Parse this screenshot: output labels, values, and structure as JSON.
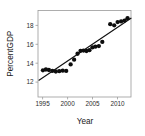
{
  "chart_data": {
    "type": "scatter",
    "title": "",
    "xlabel": "Year",
    "ylabel": "PercentGDP",
    "xlim": [
      1994.0,
      1912.8
    ],
    "x_range": [
      1994.0,
      2012.8
    ],
    "ylim": [
      11.3,
      18.6
    ],
    "grid": false,
    "legend": null,
    "x_ticks": [
      1995,
      2000,
      2005,
      2010
    ],
    "x_tick_labels": [
      "1995",
      "2000",
      "2005",
      "2010"
    ],
    "y_ticks": [
      12,
      14,
      16,
      18
    ],
    "y_tick_labels": [
      "12",
      "14",
      "16",
      "18"
    ],
    "marker": "filled-circle",
    "marker_color": "#0d0d0d",
    "line_color": "#111111",
    "points": [
      {
        "x": 1995.0,
        "y": 13.55
      },
      {
        "x": 1995.6,
        "y": 13.62
      },
      {
        "x": 1996.2,
        "y": 13.58
      },
      {
        "x": 1996.9,
        "y": 13.5
      },
      {
        "x": 1997.6,
        "y": 13.45
      },
      {
        "x": 1998.3,
        "y": 13.48
      },
      {
        "x": 1999.0,
        "y": 13.52
      },
      {
        "x": 1999.7,
        "y": 13.5
      },
      {
        "x": 2000.6,
        "y": 14.05
      },
      {
        "x": 2001.3,
        "y": 14.45
      },
      {
        "x": 2002.0,
        "y": 14.95
      },
      {
        "x": 2002.6,
        "y": 15.2
      },
      {
        "x": 2003.2,
        "y": 15.22
      },
      {
        "x": 2003.8,
        "y": 15.18
      },
      {
        "x": 2004.4,
        "y": 15.25
      },
      {
        "x": 2005.0,
        "y": 15.48
      },
      {
        "x": 2005.6,
        "y": 15.55
      },
      {
        "x": 2006.3,
        "y": 15.6
      },
      {
        "x": 2007.0,
        "y": 15.95
      },
      {
        "x": 2008.6,
        "y": 17.45
      },
      {
        "x": 2009.4,
        "y": 17.35
      },
      {
        "x": 2010.1,
        "y": 17.62
      },
      {
        "x": 2010.8,
        "y": 17.68
      },
      {
        "x": 2011.5,
        "y": 17.75
      },
      {
        "x": 2012.1,
        "y": 17.95
      }
    ],
    "fit_line": {
      "type": "linear-regression",
      "x_start": 1994.2,
      "y_start": 12.72,
      "x_end": 2012.8,
      "y_end": 17.95
    }
  }
}
